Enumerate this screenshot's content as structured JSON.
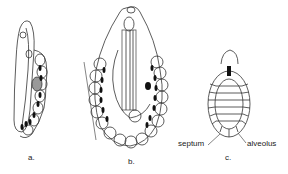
{
  "figure": {
    "panels": [
      {
        "id": "a",
        "label": "a."
      },
      {
        "id": "b",
        "label": "b."
      },
      {
        "id": "c",
        "label": "c."
      }
    ],
    "annotations": {
      "septum": "septum",
      "alveolus": "alveolus"
    },
    "colors": {
      "ink": "#222222",
      "background": "#ffffff"
    }
  }
}
